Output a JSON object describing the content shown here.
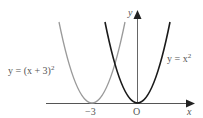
{
  "diagram": {
    "type": "graph-of-functions",
    "axes": {
      "x_label": "x",
      "y_label": "y",
      "origin_label": "O",
      "tick_labels": [
        "−3"
      ]
    },
    "curves": [
      {
        "name": "shifted-parabola",
        "equation": "y = (x + 3)²",
        "label_prefix": "y = (x + 3)",
        "label_sup": "2",
        "color": "#9a9a9a",
        "vertex": [
          -3,
          0
        ]
      },
      {
        "name": "base-parabola",
        "equation": "y = x²",
        "label_prefix": "y = x",
        "label_sup": "2",
        "color": "#1a1a1a",
        "vertex": [
          0,
          0
        ]
      }
    ]
  }
}
